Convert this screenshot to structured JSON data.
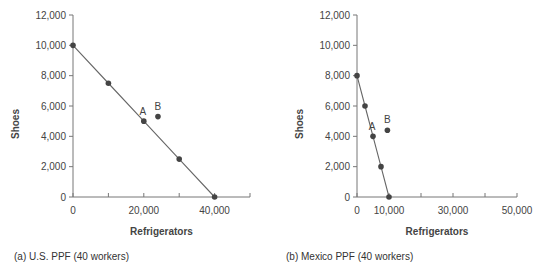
{
  "chart_data": [
    {
      "type": "line",
      "title": "(a) U.S. PPF (40 workers)",
      "xlabel": "Refrigerators",
      "ylabel": "Shoes",
      "xlim": [
        0,
        50000
      ],
      "ylim": [
        0,
        12000
      ],
      "x_ticks": [
        0,
        10000,
        20000,
        30000,
        40000,
        50000
      ],
      "x_tick_labels": [
        "0",
        "",
        "20,000",
        "",
        "40,000",
        ""
      ],
      "y_ticks": [
        0,
        2000,
        4000,
        6000,
        8000,
        10000,
        12000
      ],
      "y_tick_labels": [
        "0",
        "2,000",
        "4,000",
        "6,000",
        "8,000",
        "10,000",
        "12,000"
      ],
      "grid": false,
      "series": [
        {
          "name": "PPF",
          "x": [
            0,
            10000,
            20000,
            30000,
            40000
          ],
          "y": [
            10000,
            7500,
            5000,
            2500,
            0
          ]
        }
      ],
      "points": [
        {
          "label": "A",
          "x": 20000,
          "y": 5000
        },
        {
          "label": "B",
          "x": 24000,
          "y": 5300
        }
      ]
    },
    {
      "type": "line",
      "title": "(b) Mexico PPF (40 workers)",
      "xlabel": "Refrigerators",
      "ylabel": "Shoes",
      "xlim": [
        0,
        50000
      ],
      "ylim": [
        0,
        12000
      ],
      "x_ticks": [
        0,
        10000,
        20000,
        30000,
        40000,
        50000
      ],
      "x_tick_labels": [
        "0",
        "10,000",
        "",
        "30,000",
        "",
        "50,000"
      ],
      "y_ticks": [
        0,
        2000,
        4000,
        6000,
        8000,
        10000,
        12000
      ],
      "y_tick_labels": [
        "0",
        "2,000",
        "4,000",
        "6,000",
        "8,000",
        "10,000",
        "12,000"
      ],
      "grid": false,
      "series": [
        {
          "name": "PPF",
          "x": [
            0,
            2500,
            5000,
            7500,
            10000
          ],
          "y": [
            8000,
            6000,
            4000,
            2000,
            0
          ]
        }
      ],
      "points": [
        {
          "label": "A",
          "x": 5000,
          "y": 4000
        },
        {
          "label": "B",
          "x": 9500,
          "y": 4400
        }
      ]
    }
  ],
  "captions": {
    "left": "(a) U.S. PPF (40 workers)",
    "right": "(b) Mexico PPF (40 workers)"
  },
  "colors": {
    "axis": "#777777",
    "line": "#666666",
    "point": "#444444",
    "text": "#444444"
  }
}
